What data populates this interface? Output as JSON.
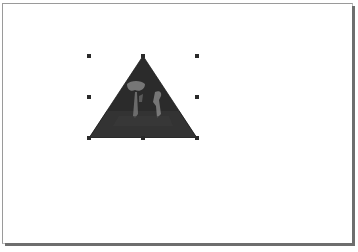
{
  "canvas": {
    "background": "#ffffff",
    "page_border": "#9a9a9a",
    "page_shadow": "#6e6e6e"
  },
  "selected_shape": {
    "type": "triangle",
    "fill": "photo-texture",
    "fill_color": "#2b2b2b",
    "selected": true,
    "bounds": {
      "x": 89,
      "y": 56,
      "width": 108,
      "height": 82
    },
    "handles": [
      "top-left",
      "top-center",
      "top-right",
      "middle-left",
      "middle-right",
      "bottom-left",
      "bottom-center",
      "bottom-right"
    ]
  }
}
